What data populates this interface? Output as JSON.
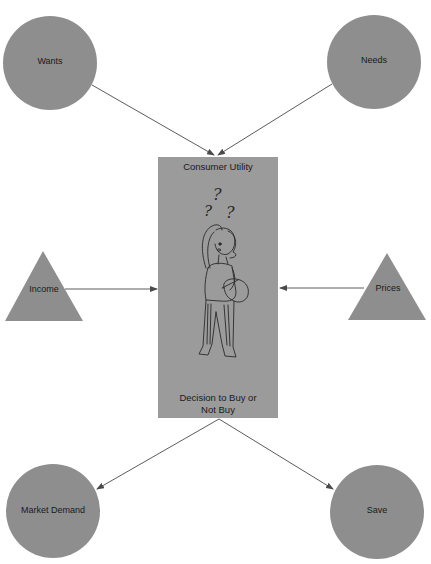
{
  "diagram": {
    "colors": {
      "background": "#ffffff",
      "node_fill": "#8e8e8e",
      "box_fill": "#9b9b9b",
      "edge": "#4a4a4a",
      "text": "#1a1a1a"
    },
    "center_box": {
      "title": "Consumer Utility",
      "footer_line1": "Decision to Buy or",
      "footer_line2": "Not Buy",
      "illustration": "confused-shopper-icon"
    },
    "nodes": {
      "wants": {
        "label": "Wants",
        "shape": "circle"
      },
      "needs": {
        "label": "Needs",
        "shape": "circle"
      },
      "income": {
        "label": "Income",
        "shape": "triangle"
      },
      "prices": {
        "label": "Prices",
        "shape": "triangle"
      },
      "market_demand": {
        "label": "Market Demand",
        "shape": "circle"
      },
      "save": {
        "label": "Save",
        "shape": "circle"
      }
    },
    "edges": [
      {
        "from": "Wants",
        "to": "Consumer Utility"
      },
      {
        "from": "Needs",
        "to": "Consumer Utility"
      },
      {
        "from": "Income",
        "to": "Consumer Utility"
      },
      {
        "from": "Prices",
        "to": "Consumer Utility"
      },
      {
        "from": "Decision to Buy or Not Buy",
        "to": "Market Demand"
      },
      {
        "from": "Decision to Buy or Not Buy",
        "to": "Save"
      }
    ]
  }
}
